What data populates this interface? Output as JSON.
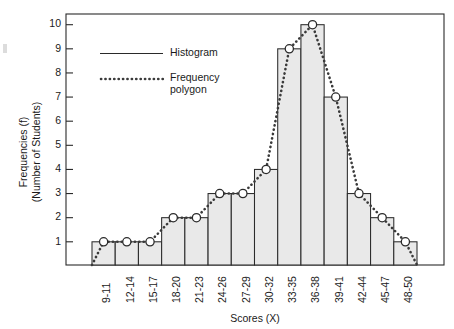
{
  "chart_data": {
    "type": "bar",
    "title": "",
    "xlabel": "Scores (X)",
    "ylabel": "Frequencies (f)\n(Number of Students)",
    "ylabel_line1": "Frequencies (f)",
    "ylabel_line2": "(Number of Students)",
    "categories": [
      "9-11",
      "12-14",
      "15-17",
      "18-20",
      "21-23",
      "24-26",
      "27-29",
      "30-32",
      "33-35",
      "36-38",
      "39-41",
      "42-44",
      "45-47",
      "48-50"
    ],
    "values": [
      1,
      1,
      1,
      2,
      2,
      3,
      3,
      4,
      9,
      10,
      7,
      3,
      2,
      1
    ],
    "series": [
      {
        "name": "Histogram",
        "style": "bar",
        "values": [
          1,
          1,
          1,
          2,
          2,
          3,
          3,
          4,
          9,
          10,
          7,
          3,
          2,
          1
        ]
      },
      {
        "name": "Frequency polygon",
        "style": "dotted-line-with-markers",
        "values": [
          1,
          1,
          1,
          2,
          2,
          3,
          3,
          4,
          9,
          10,
          7,
          3,
          2,
          1
        ]
      }
    ],
    "ylim": [
      0,
      10
    ],
    "ytick_labels": [
      "1",
      "2",
      "3",
      "4",
      "5",
      "6",
      "7",
      "8",
      "9",
      "10"
    ],
    "ytick_values": [
      1,
      2,
      3,
      4,
      5,
      6,
      7,
      8,
      9,
      10
    ],
    "grid": false,
    "legend_position": "upper-left-inside",
    "legend": [
      {
        "label": "Histogram",
        "marker": "solid-line"
      },
      {
        "label": "Frequency polygon",
        "marker": "dotted-line"
      }
    ],
    "colors": {
      "bar_fill": "#e9e9e9",
      "bar_stroke": "#2b2b2b",
      "polygon_line": "#3a3a3a",
      "marker_fill": "#ffffff",
      "axis": "#2a2a2a",
      "text": "#1a1a1a",
      "background": "#ffffff"
    }
  },
  "legend_labels": {
    "histogram": "Histogram",
    "frequency_polygon_line1": "Frequency",
    "frequency_polygon_line2": "polygon"
  },
  "axis": {
    "x_title": "Scores (X)",
    "y_title_line1": "Frequencies (f)",
    "y_title_line2": "(Number of Students)"
  }
}
